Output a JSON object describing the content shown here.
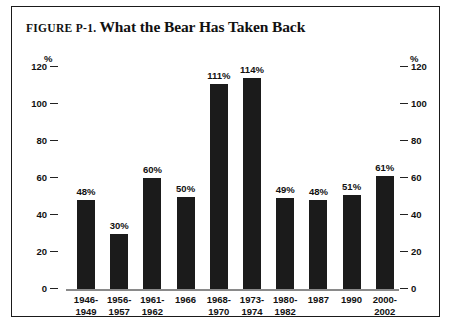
{
  "figure": {
    "number_label": "FIGURE P-1.",
    "title": "What the Bear Has Taken Back"
  },
  "axis": {
    "unit_left": "%",
    "unit_right": "%",
    "ticks": [
      "120",
      "100",
      "80",
      "60",
      "40",
      "20",
      "0"
    ]
  },
  "chart_data": {
    "type": "bar",
    "title": "What the Bear Has Taken Back",
    "xlabel": "",
    "ylabel": "%",
    "ylim": [
      0,
      120
    ],
    "yticks": [
      0,
      20,
      40,
      60,
      80,
      100,
      120
    ],
    "grid": false,
    "legend": "none",
    "dual_axis": true,
    "bar_color": "#1b1b1b",
    "categories": [
      "1946-\n1949",
      "1956-\n1957",
      "1961-\n1962",
      "1966",
      "1968-\n1970",
      "1973-\n1974",
      "1980-\n1982",
      "1987",
      "1990",
      "2000-\n2002"
    ],
    "values": [
      48,
      30,
      60,
      50,
      111,
      114,
      49,
      48,
      51,
      61
    ],
    "data_labels": [
      "48%",
      "30%",
      "60%",
      "50%",
      "111%",
      "114%",
      "49%",
      "48%",
      "51%",
      "61%"
    ]
  },
  "bars": [
    {
      "label": "48%",
      "value": 48,
      "cat_line1": "1946-",
      "cat_line2": "1949"
    },
    {
      "label": "30%",
      "value": 30,
      "cat_line1": "1956-",
      "cat_line2": "1957"
    },
    {
      "label": "60%",
      "value": 60,
      "cat_line1": "1961-",
      "cat_line2": "1962"
    },
    {
      "label": "50%",
      "value": 50,
      "cat_line1": "1966",
      "cat_line2": ""
    },
    {
      "label": "111%",
      "value": 111,
      "cat_line1": "1968-",
      "cat_line2": "1970"
    },
    {
      "label": "114%",
      "value": 114,
      "cat_line1": "1973-",
      "cat_line2": "1974"
    },
    {
      "label": "49%",
      "value": 49,
      "cat_line1": "1980-",
      "cat_line2": "1982"
    },
    {
      "label": "48%",
      "value": 48,
      "cat_line1": "1987",
      "cat_line2": ""
    },
    {
      "label": "51%",
      "value": 51,
      "cat_line1": "1990",
      "cat_line2": ""
    },
    {
      "label": "61%",
      "value": 61,
      "cat_line1": "2000-",
      "cat_line2": "2002"
    }
  ]
}
